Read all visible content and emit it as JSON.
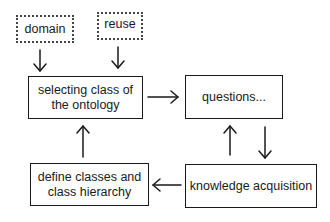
{
  "diagram": {
    "nodes": {
      "domain": {
        "label": "domain",
        "style": "dotted"
      },
      "reuse": {
        "label": "reuse",
        "style": "dotted"
      },
      "selecting": {
        "label_line1": "selecting class of",
        "label_line2": "the ontology",
        "style": "solid"
      },
      "questions": {
        "label": "questions...",
        "style": "solid"
      },
      "define": {
        "label_line1": "define classes and",
        "label_line2": "class hierarchy",
        "style": "solid"
      },
      "knowledge": {
        "label": "knowledge acquisition",
        "style": "solid"
      }
    },
    "edges": [
      {
        "from": "domain",
        "to": "selecting"
      },
      {
        "from": "reuse",
        "to": "selecting"
      },
      {
        "from": "selecting",
        "to": "questions"
      },
      {
        "from": "questions",
        "to": "knowledge"
      },
      {
        "from": "knowledge",
        "to": "questions"
      },
      {
        "from": "knowledge",
        "to": "define"
      },
      {
        "from": "define",
        "to": "selecting"
      }
    ],
    "colors": {
      "stroke": "#1a1a1a",
      "background": "#ffffff"
    }
  }
}
